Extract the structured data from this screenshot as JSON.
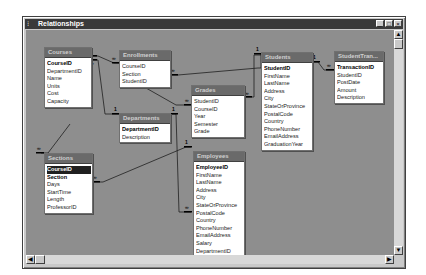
{
  "window": {
    "title": "Relationships",
    "system_icon": "⁝",
    "controls": {
      "minimize": "_",
      "maximize": "□",
      "close": "×"
    }
  },
  "tables": {
    "courses": {
      "title": "Courses",
      "fields": [
        "CourseID",
        "DepartmentID",
        "Name",
        "Units",
        "Cost",
        "Capacity"
      ],
      "keys": [
        "CourseID"
      ]
    },
    "enrollments": {
      "title": "Enrollments",
      "fields": [
        "CourseID",
        "Section",
        "StudentID"
      ],
      "keys": []
    },
    "departments": {
      "title": "Departments",
      "fields": [
        "DepartmentID",
        "Description"
      ],
      "keys": [
        "DepartmentID"
      ]
    },
    "grades": {
      "title": "Grades",
      "fields": [
        "StudentID",
        "CourseID",
        "Year",
        "Semester",
        "Grade"
      ],
      "keys": []
    },
    "students": {
      "title": "Students",
      "fields": [
        "StudentID",
        "FirstName",
        "LastName",
        "Address",
        "City",
        "StateOrProvince",
        "PostalCode",
        "Country",
        "PhoneNumber",
        "EmailAddress",
        "GraduationYear"
      ],
      "keys": [
        "StudentID"
      ]
    },
    "student_transactions": {
      "title": "StudentTran...",
      "fields": [
        "TransactionID",
        "StudentID",
        "PostDate",
        "Amount",
        "Description"
      ],
      "keys": [
        "TransactionID"
      ]
    },
    "sections": {
      "title": "Sections",
      "fields": [
        "CourseID",
        "Section",
        "Days",
        "StartTime",
        "Length",
        "ProfessorID"
      ],
      "keys": [
        "CourseID",
        "Section"
      ],
      "selected": "CourseID"
    },
    "employees": {
      "title": "Employees",
      "fields": [
        "EmployeeID",
        "FirstName",
        "LastName",
        "Address",
        "City",
        "StateOrProvince",
        "PostalCode",
        "Country",
        "PhoneNumber",
        "EmailAddress",
        "Salary",
        "DepartmentID"
      ],
      "keys": [
        "EmployeeID"
      ]
    }
  },
  "relationships": [
    {
      "from": "Courses.CourseID",
      "to": "Enrollments.CourseID",
      "one": "1",
      "many": "∞"
    },
    {
      "from": "Courses.CourseID",
      "to": "Sections.CourseID",
      "one": "1",
      "many": "∞"
    },
    {
      "from": "Departments.DepartmentID",
      "to": "Courses.DepartmentID",
      "one": "1",
      "many": "∞"
    },
    {
      "from": "Departments.DepartmentID",
      "to": "Employees.DepartmentID",
      "one": "1",
      "many": "∞"
    },
    {
      "from": "Students.StudentID",
      "to": "Enrollments.StudentID",
      "one": "1",
      "many": "∞"
    },
    {
      "from": "Students.StudentID",
      "to": "Grades.StudentID",
      "one": "1",
      "many": "∞"
    },
    {
      "from": "Students.StudentID",
      "to": "StudentTransactions.StudentID",
      "one": "1",
      "many": "∞"
    },
    {
      "from": "Employees.EmployeeID",
      "to": "Sections.ProfessorID",
      "one": "1",
      "many": "∞"
    }
  ],
  "cardinality": {
    "one": "1",
    "many": "∞"
  },
  "scrollbars": {
    "up": "▲",
    "down": "▼",
    "left": "◀",
    "right": "▶"
  }
}
